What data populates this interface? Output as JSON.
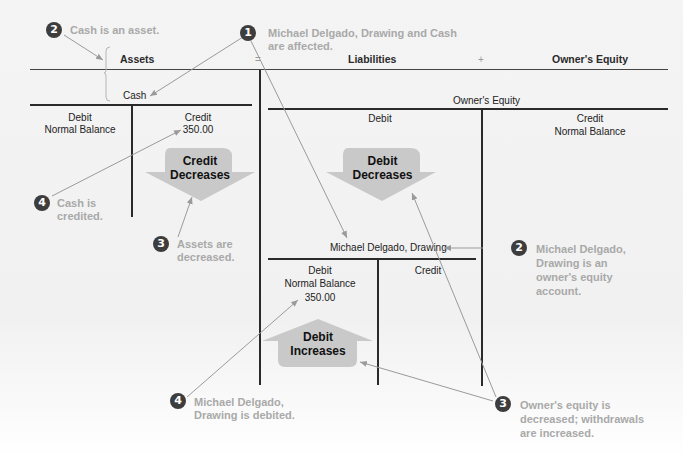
{
  "equation": {
    "assets": "Assets",
    "equals": "=",
    "liabilities": "Liabilities",
    "plus": "+",
    "owners_equity": "Owner's Equity"
  },
  "cash_account": {
    "title": "Cash",
    "left_header": "Debit",
    "left_sub": "Normal Balance",
    "right_header": "Credit",
    "right_value": "350.00",
    "arrow_label_line1": "Credit",
    "arrow_label_line2": "Decreases"
  },
  "owners_equity_account": {
    "title": "Owner's Equity",
    "left_header": "Debit",
    "right_header": "Credit",
    "right_sub": "Normal Balance",
    "arrow_label_line1": "Debit",
    "arrow_label_line2": "Decreases"
  },
  "drawing_account": {
    "title": "Michael Delgado, Drawing",
    "left_header": "Debit",
    "left_sub": "Normal Balance",
    "left_value": "350.00",
    "right_header": "Credit",
    "arrow_label_line1": "Debit",
    "arrow_label_line2": "Increases"
  },
  "callouts": [
    {
      "id": "c1",
      "number": "1",
      "text": [
        "Michael Delgado, Drawing and Cash",
        "are affected."
      ]
    },
    {
      "id": "c2a",
      "number": "2",
      "text": [
        "Cash is an asset."
      ]
    },
    {
      "id": "c2b",
      "number": "2",
      "text": [
        "Michael Delgado,",
        "Drawing is an",
        "owner's equity",
        "account."
      ]
    },
    {
      "id": "c3a",
      "number": "3",
      "text": [
        "Assets are",
        "decreased."
      ]
    },
    {
      "id": "c3b",
      "number": "3",
      "text": [
        "Owner's equity is",
        "decreased; withdrawals",
        "are increased."
      ]
    },
    {
      "id": "c4a",
      "number": "4",
      "text": [
        "Cash is",
        "credited."
      ]
    },
    {
      "id": "c4b",
      "number": "4",
      "text": [
        "Michael Delgado,",
        "Drawing is debited."
      ]
    }
  ],
  "colors": {
    "line": "#2a2a2a",
    "callout_text": "#a9a9a9",
    "badge": "#3d3d3d",
    "arrow_fill": "#c9c9c9",
    "leader_line": "#9a9a9a"
  }
}
